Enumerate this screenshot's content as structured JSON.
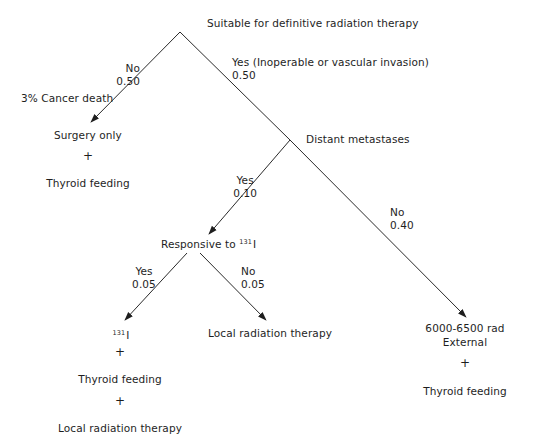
{
  "diagram": {
    "type": "decision-tree",
    "root": {
      "label": "Suitable for definitive radiation therapy"
    },
    "branches": {
      "root_no": {
        "answer": "No",
        "probability": "0.50"
      },
      "root_yes": {
        "answer": "Yes (Inoperable or vascular invasion)",
        "probability": "0.50"
      },
      "mets_yes": {
        "answer": "Yes",
        "probability": "0.10"
      },
      "mets_no": {
        "answer": "No",
        "probability": "0.40"
      },
      "resp_yes": {
        "answer": "Yes",
        "probability": "0.05"
      },
      "resp_no": {
        "answer": "No",
        "probability": "0.05"
      }
    },
    "annotations": {
      "cancer_death": "3% Cancer death"
    },
    "nodes": {
      "distant_metastases": {
        "label": "Distant metastases"
      },
      "responsive": {
        "label": "Responsive to ",
        "isotope_mass": "131",
        "isotope_symbol": "I"
      }
    },
    "outcomes": {
      "surgery": {
        "line1": "Surgery only",
        "plus1": "+",
        "line2": "Thyroid feeding"
      },
      "iodine": {
        "isotope_mass": "131",
        "isotope_symbol": "I",
        "plus1": "+",
        "line2": "Thyroid feeding",
        "plus2": "+",
        "line3": "Local radiation therapy"
      },
      "local": {
        "line1": "Local radiation therapy"
      },
      "external": {
        "line1": "6000-6500 rad",
        "line2": "External",
        "plus1": "+",
        "line3": "Thyroid feeding"
      }
    },
    "colors": {
      "line": "#2a2a2a",
      "text": "#1e1e1e",
      "background": "#ffffff"
    }
  }
}
